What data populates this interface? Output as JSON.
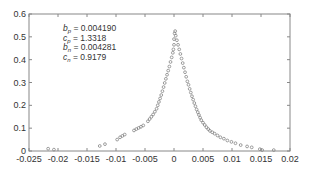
{
  "chart_data": {
    "type": "scatter",
    "title": "",
    "xlabel": "",
    "ylabel": "",
    "xlim": [
      -0.025,
      0.02
    ],
    "ylim": [
      0,
      0.6
    ],
    "grid": false,
    "legend": null,
    "x_ticks": [
      -0.025,
      -0.02,
      -0.015,
      -0.01,
      -0.005,
      0,
      0.005,
      0.01,
      0.015,
      0.02
    ],
    "x_tick_labels": [
      "-0.025",
      "-0.02",
      "-0.015",
      "-0.01",
      "-0.005",
      "0",
      "0.005",
      "0.01",
      "0.015",
      "0.02"
    ],
    "y_ticks": [
      0,
      0.1,
      0.2,
      0.3,
      0.4,
      0.5,
      0.6
    ],
    "y_tick_labels": [
      "0",
      "0.1",
      "0.2",
      "0.3",
      "0.4",
      "0.5",
      "0.6"
    ],
    "marker": "open-circle",
    "marker_color": "#777777",
    "annotations": [
      {
        "symbol": "b",
        "sub": "p",
        "value": "0.004190"
      },
      {
        "symbol": "c",
        "sub": "p",
        "value": "1.3318"
      },
      {
        "symbol": "b",
        "sub": "n",
        "value": "0.004281"
      },
      {
        "symbol": "c",
        "sub": "n",
        "value": "0.9179"
      }
    ],
    "series": [
      {
        "name": "empirical density",
        "points": [
          [
            -0.0217,
            0.01
          ],
          [
            -0.0207,
            0.006
          ],
          [
            -0.0128,
            0.022
          ],
          [
            -0.0119,
            0.03
          ],
          [
            -0.0098,
            0.05
          ],
          [
            -0.0093,
            0.06
          ],
          [
            -0.0089,
            0.066
          ],
          [
            -0.0085,
            0.072
          ],
          [
            -0.0069,
            0.09
          ],
          [
            -0.0065,
            0.096
          ],
          [
            -0.0061,
            0.101
          ],
          [
            -0.0057,
            0.106
          ],
          [
            -0.0053,
            0.112
          ],
          [
            -0.0045,
            0.13
          ],
          [
            -0.0042,
            0.14
          ],
          [
            -0.0039,
            0.15
          ],
          [
            -0.0036,
            0.16
          ],
          [
            -0.0033,
            0.172
          ],
          [
            -0.003,
            0.185
          ],
          [
            -0.0028,
            0.2
          ],
          [
            -0.0026,
            0.215
          ],
          [
            -0.0024,
            0.23
          ],
          [
            -0.0022,
            0.245
          ],
          [
            -0.002,
            0.262
          ],
          [
            -0.0018,
            0.28
          ],
          [
            -0.0016,
            0.298
          ],
          [
            -0.0014,
            0.316
          ],
          [
            -0.0012,
            0.334
          ],
          [
            -0.001,
            0.352
          ],
          [
            -0.0008,
            0.37
          ],
          [
            -0.0006,
            0.39
          ],
          [
            -0.0004,
            0.41
          ],
          [
            -0.0002,
            0.43
          ],
          [
            -0.0001,
            0.445
          ],
          [
            0.0,
            0.465
          ],
          [
            0.0,
            0.49
          ],
          [
            0.0001,
            0.515
          ],
          [
            0.0002,
            0.525
          ],
          [
            0.0003,
            0.505
          ],
          [
            0.0005,
            0.485
          ],
          [
            0.0007,
            0.465
          ],
          [
            0.0009,
            0.445
          ],
          [
            0.0011,
            0.425
          ],
          [
            0.0013,
            0.405
          ],
          [
            0.0015,
            0.385
          ],
          [
            0.0017,
            0.365
          ],
          [
            0.0019,
            0.345
          ],
          [
            0.0021,
            0.325
          ],
          [
            0.0023,
            0.305
          ],
          [
            0.0025,
            0.29
          ],
          [
            0.0027,
            0.272
          ],
          [
            0.0029,
            0.256
          ],
          [
            0.0031,
            0.24
          ],
          [
            0.0033,
            0.225
          ],
          [
            0.0035,
            0.21
          ],
          [
            0.0037,
            0.196
          ],
          [
            0.0039,
            0.182
          ],
          [
            0.0041,
            0.17
          ],
          [
            0.0043,
            0.158
          ],
          [
            0.0045,
            0.146
          ],
          [
            0.0047,
            0.135
          ],
          [
            0.005,
            0.124
          ],
          [
            0.0053,
            0.114
          ],
          [
            0.0056,
            0.104
          ],
          [
            0.0059,
            0.096
          ],
          [
            0.0062,
            0.088
          ],
          [
            0.0066,
            0.082
          ],
          [
            0.007,
            0.076
          ],
          [
            0.0075,
            0.068
          ],
          [
            0.008,
            0.06
          ],
          [
            0.0086,
            0.054
          ],
          [
            0.0092,
            0.046
          ],
          [
            0.0099,
            0.04
          ],
          [
            0.0106,
            0.034
          ],
          [
            0.0115,
            0.026
          ],
          [
            0.0126,
            0.02
          ],
          [
            0.0134,
            0.016
          ],
          [
            0.0148,
            0.008
          ],
          [
            0.0152,
            0.004
          ],
          [
            0.0172,
            0.004
          ]
        ]
      }
    ]
  }
}
